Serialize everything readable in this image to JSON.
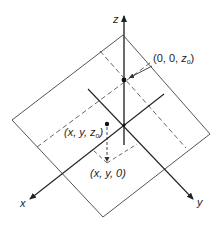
{
  "figure": {
    "colors": {
      "background": "#ffffff",
      "line": "#333333",
      "plane": "#555555",
      "dashed": "#555555"
    },
    "axes": {
      "x_label": "x",
      "y_label": "y",
      "z_label": "z"
    },
    "points": [
      {
        "id": "p0",
        "label_open": "(0, 0, ",
        "label_var": "z",
        "label_sub": "o",
        "label_close": ")"
      },
      {
        "id": "p1",
        "label_open": "(x, y, ",
        "label_var": "z",
        "label_sub": "o",
        "label_close": ")"
      },
      {
        "id": "p2",
        "label": "(x, y, 0)"
      }
    ]
  }
}
